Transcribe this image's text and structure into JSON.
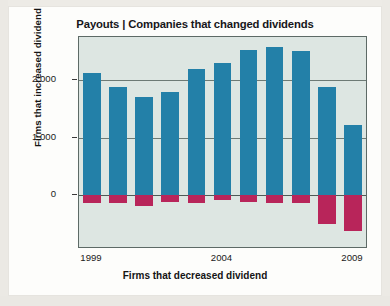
{
  "chart_data": {
    "type": "bar",
    "title": "Payouts | Companies that changed dividends",
    "xlabel": "Firms that decreased dividend",
    "ylabel": "Firms that increased dividend",
    "categories": [
      "1999",
      "2000",
      "2001",
      "2002",
      "2003",
      "2004",
      "2005",
      "2006",
      "2007",
      "2008",
      "2009"
    ],
    "x_tick_labels": [
      "1999",
      "2004",
      "2009"
    ],
    "x_tick_categories": [
      "1999",
      "2004",
      "2009"
    ],
    "y_tick_labels": [
      "2,000",
      "1,000",
      "0"
    ],
    "y_tick_values": [
      2000,
      1000,
      0
    ],
    "ylim": [
      -900,
      2750
    ],
    "grid": true,
    "legend": "none",
    "series": [
      {
        "name": "Firms that increased dividend",
        "color": "#2380a8",
        "values": [
          2120,
          1880,
          1700,
          1790,
          2190,
          2300,
          2520,
          2570,
          2500,
          1890,
          1230
        ]
      },
      {
        "name": "Firms that decreased dividend",
        "color": "#b8255a",
        "values": [
          -130,
          -130,
          -180,
          -120,
          -130,
          -90,
          -120,
          -130,
          -140,
          -500,
          -620
        ]
      }
    ]
  },
  "figure": {
    "title": "Payouts | Companies that changed dividends",
    "y_axis_label": "Firms that increased dividend",
    "x_axis_label": "Firms that decreased dividend"
  }
}
